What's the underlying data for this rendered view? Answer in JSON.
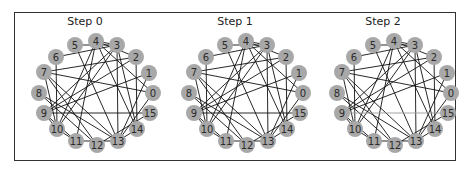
{
  "figure": {
    "frame": {
      "left": 14,
      "top": 12,
      "width": 442,
      "height": 149
    },
    "colors": {
      "node_fill": "#a8a8a8",
      "edge": "#111111",
      "highlight_edge": "#9a9a9a",
      "label": "#2b2b2b",
      "frame": "#333333"
    },
    "node_radius": 8,
    "node_positions": {
      "0": [
        58,
        -2
      ],
      "1": [
        54,
        -22
      ],
      "2": [
        41,
        -38
      ],
      "3": [
        22,
        -50
      ],
      "4": [
        1,
        -54
      ],
      "5": [
        -20,
        -50
      ],
      "6": [
        -39,
        -38
      ],
      "7": [
        -51,
        -23
      ],
      "8": [
        -56,
        -2
      ],
      "9": [
        -51,
        18
      ],
      "10": [
        -38,
        34
      ],
      "11": [
        -19,
        46
      ],
      "12": [
        2,
        50
      ],
      "13": [
        23,
        46
      ],
      "14": [
        42,
        34
      ],
      "15": [
        55,
        18
      ]
    },
    "panels": [
      {
        "title": "Step 0",
        "offset_x": 10,
        "center": [
          85,
          95
        ],
        "edges": [
          [
            4,
            3
          ],
          [
            4,
            2
          ],
          [
            4,
            10
          ],
          [
            4,
            11
          ],
          [
            4,
            14
          ],
          [
            4,
            0
          ],
          [
            5,
            13
          ],
          [
            6,
            3
          ],
          [
            6,
            10
          ],
          [
            3,
            9
          ],
          [
            3,
            10
          ],
          [
            3,
            13
          ],
          [
            3,
            14
          ],
          [
            2,
            7
          ],
          [
            2,
            9
          ],
          [
            2,
            14
          ],
          [
            7,
            0
          ],
          [
            7,
            13
          ],
          [
            7,
            12
          ],
          [
            7,
            10
          ],
          [
            1,
            9
          ],
          [
            1,
            13
          ],
          [
            8,
            12
          ],
          [
            8,
            13
          ],
          [
            9,
            15
          ],
          [
            9,
            10
          ],
          [
            0,
            13
          ],
          [
            5,
            3
          ],
          [
            11,
            13
          ],
          [
            12,
            15
          ],
          [
            14,
            13
          ],
          [
            10,
            11
          ],
          [
            9,
            11
          ]
        ],
        "highlight_edges": []
      },
      {
        "title": "Step 1",
        "offset_x": 160,
        "center": [
          85,
          95
        ],
        "edges": [
          [
            4,
            3
          ],
          [
            4,
            2
          ],
          [
            4,
            10
          ],
          [
            4,
            11
          ],
          [
            4,
            14
          ],
          [
            4,
            0
          ],
          [
            5,
            13
          ],
          [
            6,
            3
          ],
          [
            6,
            10
          ],
          [
            3,
            9
          ],
          [
            3,
            10
          ],
          [
            3,
            13
          ],
          [
            3,
            14
          ],
          [
            2,
            7
          ],
          [
            2,
            9
          ],
          [
            2,
            14
          ],
          [
            7,
            0
          ],
          [
            7,
            13
          ],
          [
            7,
            12
          ],
          [
            7,
            10
          ],
          [
            1,
            9
          ],
          [
            1,
            13
          ],
          [
            8,
            12
          ],
          [
            8,
            13
          ],
          [
            9,
            15
          ],
          [
            9,
            10
          ],
          [
            0,
            13
          ],
          [
            5,
            3
          ],
          [
            11,
            13
          ],
          [
            12,
            15
          ],
          [
            14,
            13
          ],
          [
            10,
            11
          ],
          [
            9,
            11
          ]
        ],
        "highlight_edges": []
      },
      {
        "title": "Step 2",
        "offset_x": 308,
        "center": [
          85,
          95
        ],
        "edges": [
          [
            4,
            3
          ],
          [
            4,
            2
          ],
          [
            4,
            10
          ],
          [
            4,
            11
          ],
          [
            4,
            14
          ],
          [
            4,
            0
          ],
          [
            5,
            13
          ],
          [
            6,
            3
          ],
          [
            6,
            10
          ],
          [
            3,
            9
          ],
          [
            3,
            10
          ],
          [
            3,
            13
          ],
          [
            3,
            14
          ],
          [
            2,
            7
          ],
          [
            2,
            9
          ],
          [
            2,
            14
          ],
          [
            7,
            0
          ],
          [
            7,
            13
          ],
          [
            7,
            12
          ],
          [
            7,
            10
          ],
          [
            1,
            9
          ],
          [
            1,
            13
          ],
          [
            8,
            12
          ],
          [
            8,
            13
          ],
          [
            9,
            10
          ],
          [
            0,
            13
          ],
          [
            5,
            3
          ],
          [
            11,
            13
          ],
          [
            12,
            15
          ],
          [
            14,
            13
          ],
          [
            10,
            11
          ],
          [
            9,
            11
          ]
        ],
        "highlight_edges": [
          [
            9,
            15
          ]
        ]
      }
    ]
  }
}
